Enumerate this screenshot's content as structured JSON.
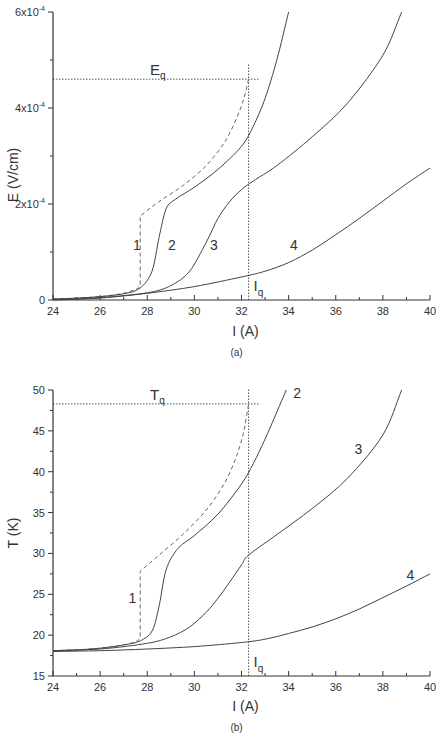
{
  "chart_data": [
    {
      "id": "a",
      "type": "line",
      "panel_label": "(a)",
      "title": "",
      "xlabel": "I (A)",
      "ylabel": "E (V/cm)",
      "xlim": [
        24,
        40
      ],
      "ylim": [
        0,
        0.0006
      ],
      "grid": false,
      "x_ticks": [
        "24",
        "26",
        "28",
        "30",
        "32",
        "34",
        "36",
        "38",
        "40"
      ],
      "y_ticks": [
        {
          "value": 0,
          "label": "0",
          "sup": ""
        },
        {
          "value": 0.0002,
          "label": "2x10",
          "sup": "-4"
        },
        {
          "value": 0.0004,
          "label": "4x10",
          "sup": "-4"
        },
        {
          "value": 0.0006,
          "label": "6x10",
          "sup": "-4"
        }
      ],
      "annotations": [
        {
          "text": "E",
          "sub": "q",
          "value": 0.00046,
          "kind": "horizontal-dotted"
        },
        {
          "text": "I",
          "sub": "q",
          "value": 32.3,
          "kind": "vertical-dotted"
        }
      ],
      "series": [
        {
          "name": "1",
          "style": "dashed",
          "x": [
            24,
            25,
            26,
            27,
            27.5,
            27.7,
            27.7,
            28.5,
            29.5,
            30.5,
            31.3,
            31.8,
            32.1,
            32.3
          ],
          "y": [
            2e-06,
            4e-06,
            7e-06,
            1.4e-05,
            2.2e-05,
            2.8e-05,
            0.000175,
            0.000205,
            0.000238,
            0.00028,
            0.00033,
            0.00038,
            0.00042,
            0.00046
          ]
        },
        {
          "name": "2",
          "style": "solid",
          "x": [
            24,
            25,
            26,
            27,
            27.7,
            28.2,
            28.5,
            28.8,
            29.2,
            30,
            31,
            32,
            32.5,
            33,
            33.5,
            34
          ],
          "y": [
            2e-06,
            4e-06,
            7e-06,
            1.3e-05,
            2.5e-05,
            6e-05,
            0.00013,
            0.00019,
            0.00021,
            0.000235,
            0.000272,
            0.00032,
            0.000362,
            0.00042,
            0.0005,
            0.0006
          ]
        },
        {
          "name": "3",
          "style": "solid",
          "x": [
            24,
            26,
            28,
            29,
            29.8,
            30.5,
            31,
            31.5,
            32,
            32.5,
            33.5,
            35,
            36.5,
            38,
            38.8
          ],
          "y": [
            1e-06,
            5e-06,
            1.5e-05,
            3e-05,
            6e-05,
            0.00012,
            0.00017,
            0.000205,
            0.00023,
            0.000248,
            0.00028,
            0.00034,
            0.00041,
            0.00051,
            0.0006
          ]
        },
        {
          "name": "4",
          "style": "solid",
          "x": [
            24,
            26,
            28,
            30,
            32,
            33,
            34,
            35,
            36,
            37,
            38,
            39,
            40
          ],
          "y": [
            0.0,
            4e-06,
            1.4e-05,
            2.8e-05,
            4.8e-05,
            6e-05,
            7.8e-05,
            0.000104,
            0.000136,
            0.00017,
            0.000206,
            0.000242,
            0.000275
          ]
        }
      ],
      "curve_labels": [
        {
          "text": "1",
          "x": 27.3,
          "y": 9e-05
        },
        {
          "text": "2",
          "x": 28.9,
          "y": 9e-05
        },
        {
          "text": "3",
          "x": 30.2,
          "y": 9e-05
        },
        {
          "text": "4",
          "x": 34.1,
          "y": 9e-05
        }
      ]
    },
    {
      "id": "b",
      "type": "line",
      "panel_label": "(b)",
      "title": "",
      "xlabel": "I (A)",
      "ylabel": "T (K)",
      "xlim": [
        24,
        40
      ],
      "ylim": [
        15,
        50
      ],
      "grid": false,
      "x_ticks": [
        "24",
        "26",
        "28",
        "30",
        "32",
        "34",
        "36",
        "38",
        "40"
      ],
      "y_ticks": [
        {
          "value": 15,
          "label": "15",
          "sup": ""
        },
        {
          "value": 20,
          "label": "20",
          "sup": ""
        },
        {
          "value": 25,
          "label": "25",
          "sup": ""
        },
        {
          "value": 30,
          "label": "30",
          "sup": ""
        },
        {
          "value": 35,
          "label": "35",
          "sup": ""
        },
        {
          "value": 40,
          "label": "40",
          "sup": ""
        },
        {
          "value": 45,
          "label": "45",
          "sup": ""
        },
        {
          "value": 50,
          "label": "50",
          "sup": ""
        }
      ],
      "annotations": [
        {
          "text": "T",
          "sub": "q",
          "value": 48.3,
          "kind": "horizontal-dotted"
        },
        {
          "text": "I",
          "sub": "q",
          "value": 32.3,
          "kind": "vertical-dotted"
        }
      ],
      "series": [
        {
          "name": "1",
          "style": "dashed",
          "x": [
            24,
            25,
            26,
            27,
            27.5,
            27.7,
            27.7,
            28.5,
            29.5,
            30.5,
            31.3,
            31.8,
            32.1,
            32.3
          ],
          "y": [
            18.1,
            18.2,
            18.4,
            18.8,
            19.2,
            19.6,
            27.8,
            29.8,
            32.3,
            35.3,
            38.7,
            42.0,
            45.0,
            48.3
          ]
        },
        {
          "name": "2",
          "style": "solid",
          "x": [
            24,
            25,
            26,
            27,
            27.7,
            28.2,
            28.5,
            28.8,
            29.3,
            30,
            31,
            32,
            32.5,
            33,
            33.5,
            33.9
          ],
          "y": [
            18.1,
            18.2,
            18.4,
            18.8,
            19.3,
            20.5,
            23.5,
            28.0,
            30.6,
            32.2,
            34.8,
            38.5,
            41.0,
            44.0,
            47.3,
            50.0
          ]
        },
        {
          "name": "3",
          "style": "solid",
          "x": [
            24,
            26,
            28,
            29,
            29.8,
            30.5,
            31,
            31.5,
            32,
            32.3,
            33.5,
            35,
            36.5,
            38,
            38.8
          ],
          "y": [
            18.1,
            18.3,
            19.0,
            19.8,
            21.0,
            22.8,
            24.5,
            26.5,
            28.6,
            29.8,
            32.3,
            35.5,
            39.2,
            44.5,
            50.0
          ]
        },
        {
          "name": "4",
          "style": "solid",
          "x": [
            24,
            26,
            28,
            30,
            32,
            33,
            34,
            35,
            36,
            37,
            38,
            39,
            40
          ],
          "y": [
            18.0,
            18.1,
            18.3,
            18.6,
            19.1,
            19.5,
            20.2,
            21.0,
            22.0,
            23.2,
            24.6,
            26.0,
            27.5
          ]
        }
      ],
      "curve_labels": [
        {
          "text": "1",
          "x": 27.2,
          "y": 24.6
        },
        {
          "text": "2",
          "x": 34.2,
          "y": 49.6
        },
        {
          "text": "3",
          "x": 36.8,
          "y": 42.8
        },
        {
          "text": "4",
          "x": 39.0,
          "y": 27.3
        }
      ]
    }
  ]
}
